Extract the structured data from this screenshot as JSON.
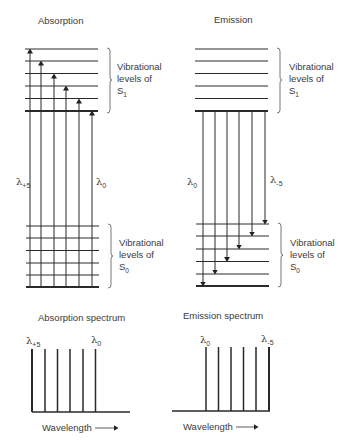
{
  "panels": {
    "absorption": {
      "title": "Absorption",
      "upper_bracket": {
        "line1": "Vibrational",
        "line2": "levels of",
        "state": "S",
        "sub": "1"
      },
      "lower_bracket": {
        "line1": "Vibrational",
        "line2": "levels of",
        "state": "S",
        "sub": "0"
      },
      "left_label": {
        "symbol": "λ",
        "sub": "+5"
      },
      "right_label": {
        "symbol": "λ",
        "sub": "0"
      }
    },
    "emission": {
      "title": "Emission",
      "upper_bracket": {
        "line1": "Vibrational",
        "line2": "levels of",
        "state": "S",
        "sub": "1"
      },
      "lower_bracket": {
        "line1": "Vibrational",
        "line2": "levels of",
        "state": "S",
        "sub": "0"
      },
      "left_label": {
        "symbol": "λ",
        "sub": "0"
      },
      "right_label": {
        "symbol": "λ",
        "sub": "-5"
      }
    }
  },
  "spectra": {
    "absorption": {
      "title": "Absorption spectrum",
      "left_label": {
        "symbol": "λ",
        "sub": "+5"
      },
      "right_label": {
        "symbol": "λ",
        "sub": "0"
      },
      "axis_label": "Wavelength",
      "arrow": "→"
    },
    "emission": {
      "title": "Emission spectrum",
      "left_label": {
        "symbol": "λ",
        "sub": "0"
      },
      "right_label": {
        "symbol": "λ",
        "sub": "-5"
      },
      "axis_label": "Wavelength",
      "arrow": "→"
    }
  },
  "colors": {
    "line": "#2a2a2a",
    "text": "#3a3a3a",
    "background": "#ffffff"
  }
}
